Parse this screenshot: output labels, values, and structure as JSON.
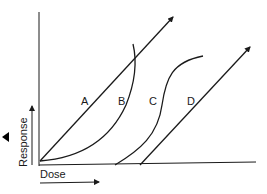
{
  "diagram": {
    "type": "dose-response curves",
    "axes": {
      "x_label": "Dose",
      "y_label": "Response"
    },
    "curves": [
      {
        "id": "A",
        "label": "A",
        "shape": "straight line with arrow, starting at origin"
      },
      {
        "id": "B",
        "label": "B",
        "shape": "upward-curving (convex) curve from origin"
      },
      {
        "id": "C",
        "label": "C",
        "shape": "sigmoid curve with threshold"
      },
      {
        "id": "D",
        "label": "D",
        "shape": "straight line with arrow, starting at threshold dose"
      }
    ],
    "marker": "left-pointing triangle",
    "colors": {
      "stroke": "#1a1a1a",
      "background": "#ffffff"
    }
  }
}
